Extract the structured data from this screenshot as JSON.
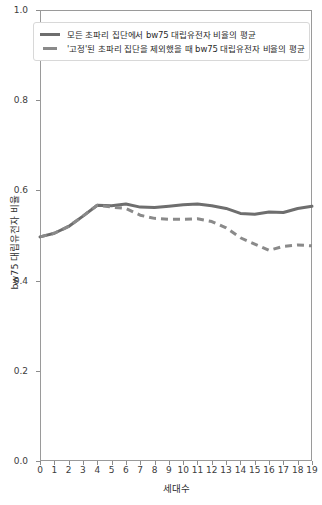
{
  "chart_data": {
    "type": "line",
    "title": "",
    "xlabel": "세대수",
    "ylabel": "bw75 대립유전자 비율",
    "xlim": [
      0,
      19
    ],
    "ylim": [
      0.0,
      1.0
    ],
    "grid": false,
    "legend_position": "upper-left",
    "x": [
      0,
      1,
      2,
      3,
      4,
      5,
      6,
      7,
      8,
      9,
      10,
      11,
      12,
      13,
      14,
      15,
      16,
      17,
      18,
      19
    ],
    "xticklabels": [
      "0",
      "1",
      "2",
      "3",
      "4",
      "5",
      "6",
      "7",
      "8",
      "9",
      "10",
      "11",
      "12",
      "13",
      "14",
      "15",
      "16",
      "17",
      "18",
      "19"
    ],
    "yticklabels": [
      "0.0",
      "0.2",
      "0.4",
      "0.6",
      "0.8",
      "1.0"
    ],
    "yticks": [
      0.0,
      0.2,
      0.4,
      0.6,
      0.8,
      1.0
    ],
    "series": [
      {
        "name": "모든 초파리 집단에서 bw75 대립유전자 비율의 평균",
        "style": "solid",
        "color": "#6e6e6e",
        "values": [
          0.497,
          0.505,
          0.52,
          0.543,
          0.567,
          0.566,
          0.57,
          0.563,
          0.562,
          0.565,
          0.568,
          0.57,
          0.566,
          0.56,
          0.549,
          0.547,
          0.552,
          0.551,
          0.56,
          0.565
        ]
      },
      {
        "name": "'고정'된 초파리 집단을 제외했을 때 bw75 대립유전자 비율의 평균",
        "style": "dashed",
        "color": "#8a8a8a",
        "values": [
          0.497,
          0.505,
          0.52,
          0.543,
          0.567,
          0.563,
          0.56,
          0.545,
          0.538,
          0.536,
          0.536,
          0.537,
          0.531,
          0.517,
          0.495,
          0.481,
          0.467,
          0.476,
          0.479,
          0.477
        ]
      }
    ]
  },
  "legend": {
    "items": [
      {
        "label": "모든 초파리 집단에서 bw75 대립유전자 비율의 평균",
        "style": "solid"
      },
      {
        "label": "'고정'된 초파리 집단을 제외했을 때 bw75 대립유전자 비율의 평균",
        "style": "dashed"
      }
    ]
  },
  "colors": {
    "series_solid": "#6e6e6e",
    "series_dashed": "#8a8a8a",
    "axis": "#9a9a9a",
    "background": "#ffffff"
  }
}
